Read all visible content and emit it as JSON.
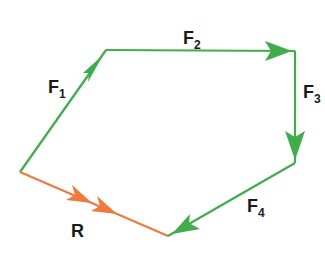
{
  "diagram": {
    "colors": {
      "force": "#3fae4a",
      "resultant": "#f07a3c",
      "text": "#1a1a1a"
    },
    "vectors": [
      {
        "id": "F1",
        "label": "F",
        "subscript": "1",
        "from": [
          20,
          172
        ],
        "to": [
          106,
          50
        ],
        "color": "#3fae4a"
      },
      {
        "id": "F2",
        "label": "F",
        "subscript": "2",
        "from": [
          106,
          50
        ],
        "to": [
          295,
          51
        ],
        "color": "#3fae4a"
      },
      {
        "id": "F3",
        "label": "F",
        "subscript": "3",
        "from": [
          295,
          51
        ],
        "to": [
          295,
          163
        ],
        "color": "#3fae4a"
      },
      {
        "id": "F4",
        "label": "F",
        "subscript": "4",
        "from": [
          295,
          163
        ],
        "to": [
          168,
          236
        ],
        "color": "#3fae4a"
      },
      {
        "id": "R",
        "label": "R",
        "subscript": "",
        "from": [
          20,
          172
        ],
        "to": [
          168,
          236
        ],
        "color": "#f07a3c"
      }
    ],
    "labels": {
      "F1": {
        "main": "F",
        "sub": "1"
      },
      "F2": {
        "main": "F",
        "sub": "2"
      },
      "F3": {
        "main": "F",
        "sub": "3"
      },
      "F4": {
        "main": "F",
        "sub": "4"
      },
      "R": {
        "main": "R"
      }
    }
  }
}
